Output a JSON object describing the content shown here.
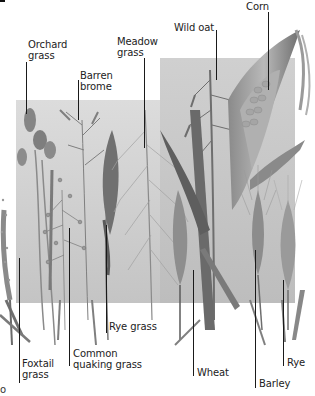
{
  "figure": {
    "background_panel_color": "#c9c9c9",
    "ink_color": "#1a1a1a",
    "corner_glyph": "o"
  },
  "labels": [
    {
      "id": "orchard-grass",
      "line1": "Orchard",
      "line2": "grass"
    },
    {
      "id": "barren-brome",
      "line1": "Barren",
      "line2": "brome"
    },
    {
      "id": "meadow-grass",
      "line1": "Meadow",
      "line2": "grass"
    },
    {
      "id": "wild-oat",
      "line1": "Wild oat",
      "line2": ""
    },
    {
      "id": "corn",
      "line1": "Corn",
      "line2": ""
    },
    {
      "id": "foxtail-grass",
      "line1": "Foxtail",
      "line2": "grass"
    },
    {
      "id": "common-quaking-grass",
      "line1": "Common",
      "line2": "quaking grass"
    },
    {
      "id": "rye-grass",
      "line1": "Rye grass",
      "line2": ""
    },
    {
      "id": "wheat",
      "line1": "Wheat",
      "line2": ""
    },
    {
      "id": "barley",
      "line1": "Barley",
      "line2": ""
    },
    {
      "id": "rye",
      "line1": "Rye",
      "line2": ""
    }
  ]
}
